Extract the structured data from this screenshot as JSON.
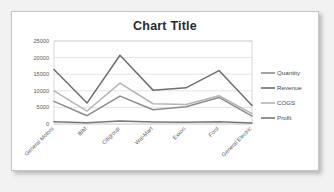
{
  "card": {
    "background_color": "#ffffff",
    "border_color": "#c6c6c6"
  },
  "page": {
    "background_color": "#f2f2f2"
  },
  "chart_data": {
    "type": "line",
    "title": "Chart Title",
    "xlabel": "",
    "ylabel": "",
    "ylim": [
      0,
      25000
    ],
    "grid": true,
    "legend_position": "right",
    "categories": [
      "General Motors",
      "IBM",
      "Citigroup",
      "Wal-Mart",
      "Exxon",
      "Ford",
      "General Electric"
    ],
    "yticks": [
      0,
      5000,
      10000,
      15000,
      20000,
      25000
    ],
    "ytick_labels": [
      "0",
      "5000",
      "10000",
      "15000",
      "20000",
      "25000"
    ],
    "series": [
      {
        "name": "Quantity",
        "color": "#8c8c8c",
        "values": [
          6800,
          2500,
          8400,
          4300,
          5200,
          8000,
          2400
        ]
      },
      {
        "name": "Revenue",
        "color": "#6e6e6e",
        "values": [
          16400,
          6300,
          20700,
          10200,
          10900,
          16100,
          5600
        ]
      },
      {
        "name": "COGS",
        "color": "#b5b5b5",
        "values": [
          10000,
          3900,
          12300,
          6100,
          5900,
          8500,
          3100
        ]
      },
      {
        "name": "Profit",
        "color": "#777777",
        "values": [
          700,
          400,
          900,
          600,
          500,
          700,
          300
        ]
      }
    ]
  }
}
